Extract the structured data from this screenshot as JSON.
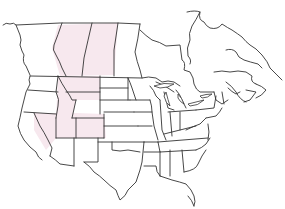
{
  "map": {
    "type": "blank outline map",
    "region": "North America (United States and Canada)",
    "background_color": "#ffffff",
    "line_color": "#333333",
    "highlight_color": "#f7e8ee",
    "highlighted_regions": [
      "Alberta",
      "Saskatchewan",
      "Idaho",
      "Montana",
      "Wyoming",
      "Nevada",
      "Utah",
      "Colorado"
    ],
    "labels": []
  }
}
